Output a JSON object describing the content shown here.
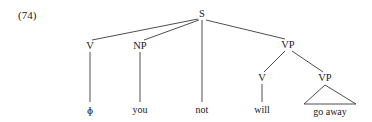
{
  "figure": {
    "example_number": "(74)",
    "background_color": "#ffffff",
    "line_color": "#3a3a3a",
    "text_color": "#1a1a1a"
  },
  "chart_data": {
    "type": "diagram",
    "diagram_kind": "syntax-tree",
    "title": "(74)",
    "nodes": [
      {
        "id": "S",
        "label": "S",
        "x": 202,
        "y": 14,
        "kind": "nonterminal"
      },
      {
        "id": "V1",
        "label": "V",
        "x": 90,
        "y": 46,
        "kind": "nonterminal"
      },
      {
        "id": "NP",
        "label": "NP",
        "x": 140,
        "y": 46,
        "kind": "nonterminal"
      },
      {
        "id": "VP1",
        "label": "VP",
        "x": 288,
        "y": 45,
        "kind": "nonterminal"
      },
      {
        "id": "V2",
        "label": "V",
        "x": 262,
        "y": 78,
        "kind": "nonterminal"
      },
      {
        "id": "VP2",
        "label": "VP",
        "x": 325,
        "y": 78,
        "kind": "nonterminal"
      }
    ],
    "leaves": [
      {
        "id": "leaf-phi",
        "label": "ɸ",
        "x": 90,
        "y": 110,
        "parent": "V1"
      },
      {
        "id": "leaf-you",
        "label": "you",
        "x": 140,
        "y": 110,
        "parent": "NP"
      },
      {
        "id": "leaf-not",
        "label": "not",
        "x": 202,
        "y": 110,
        "parent": "S"
      },
      {
        "id": "leaf-will",
        "label": "will",
        "x": 262,
        "y": 110,
        "parent": "V2"
      },
      {
        "id": "leaf-goaway",
        "label": "go away",
        "x": 330,
        "y": 112,
        "parent": "VP2"
      }
    ],
    "edges": [
      {
        "from": "S",
        "to": "V1",
        "x1": 198,
        "y1": 19,
        "x2": 92,
        "y2": 40
      },
      {
        "from": "S",
        "to": "NP",
        "x1": 199,
        "y1": 20,
        "x2": 144,
        "y2": 40
      },
      {
        "from": "S",
        "to": "leaf-not",
        "x1": 202,
        "y1": 20,
        "x2": 202,
        "y2": 102
      },
      {
        "from": "S",
        "to": "VP1",
        "x1": 206,
        "y1": 20,
        "x2": 285,
        "y2": 39
      },
      {
        "from": "V1",
        "to": "leaf-phi",
        "x1": 90,
        "y1": 52,
        "x2": 90,
        "y2": 102
      },
      {
        "from": "NP",
        "to": "leaf-you",
        "x1": 140,
        "y1": 52,
        "x2": 140,
        "y2": 102
      },
      {
        "from": "VP1",
        "to": "V2",
        "x1": 285,
        "y1": 51,
        "x2": 264,
        "y2": 72
      },
      {
        "from": "VP1",
        "to": "VP2",
        "x1": 292,
        "y1": 51,
        "x2": 323,
        "y2": 72
      },
      {
        "from": "V2",
        "to": "leaf-will",
        "x1": 262,
        "y1": 84,
        "x2": 262,
        "y2": 102
      }
    ],
    "triangle": {
      "parent": "VP2",
      "apex_x": 325,
      "apex_y": 85,
      "left_x": 304,
      "left_y": 104,
      "right_x": 356,
      "right_y": 104,
      "covers": "go away"
    }
  }
}
